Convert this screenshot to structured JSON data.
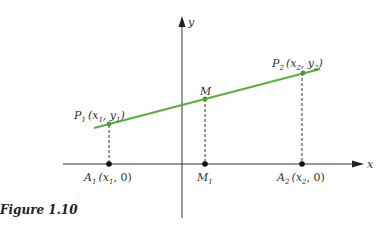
{
  "figure": {
    "caption": "Figure 1.10",
    "axes": {
      "x_label": "x",
      "y_label": "y"
    },
    "colors": {
      "line": "#5aae3c",
      "axis": "#333333",
      "point": "#222222"
    },
    "points": {
      "P1": {
        "name": "P",
        "sub": "1",
        "coords": "(x1, y1)"
      },
      "M": {
        "name": "M"
      },
      "P2": {
        "name": "P",
        "sub": "2",
        "coords": "(x2, y2)"
      },
      "A1": {
        "name": "A",
        "sub": "1",
        "coords": "(x1, 0)"
      },
      "M1": {
        "name": "M",
        "sub": "1"
      },
      "A2": {
        "name": "A",
        "sub": "2",
        "coords": "(x2, 0)"
      }
    }
  }
}
